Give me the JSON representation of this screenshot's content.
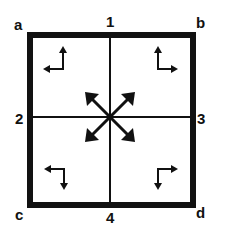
{
  "diagram": {
    "colors": {
      "stroke": "#111111",
      "background": "#ffffff"
    },
    "corner_labels": {
      "top_left": "a",
      "top_right": "b",
      "bottom_left": "c",
      "bottom_right": "d"
    },
    "edge_labels": {
      "top": "1",
      "left": "2",
      "right": "3",
      "bottom": "4"
    },
    "quadrant_arrows": [
      {
        "quadrant": "top-left",
        "directions": [
          "up",
          "left"
        ]
      },
      {
        "quadrant": "top-right",
        "directions": [
          "up",
          "right"
        ]
      },
      {
        "quadrant": "bottom-left",
        "directions": [
          "left",
          "down"
        ]
      },
      {
        "quadrant": "bottom-right",
        "directions": [
          "right",
          "down"
        ]
      }
    ],
    "center_arrows": {
      "directions": [
        "up-left",
        "up-right",
        "down-left",
        "down-right"
      ]
    }
  }
}
